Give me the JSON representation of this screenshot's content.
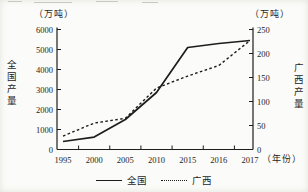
{
  "chart_data": {
    "type": "line",
    "categories": [
      "1995",
      "2000",
      "2005",
      "2010",
      "2015",
      "2016",
      "2017"
    ],
    "series": [
      {
        "name": "全国",
        "axis": "left",
        "style": "solid",
        "values": [
          400,
          620,
          1500,
          2850,
          5100,
          5300,
          5450
        ]
      },
      {
        "name": "广西",
        "axis": "right",
        "style": "dashed",
        "values": [
          28,
          55,
          65,
          128,
          153,
          175,
          227
        ]
      }
    ],
    "left_axis": {
      "unit": "（万吨）",
      "title": "全国产量",
      "min": 0,
      "max": 6000,
      "step": 1000,
      "ticks": [
        "0",
        "1000",
        "2000",
        "3000",
        "4000",
        "5000",
        "6000"
      ]
    },
    "right_axis": {
      "unit": "（万吨）",
      "title": "广西产量",
      "min": 0,
      "max": 250,
      "step": 50,
      "ticks": [
        "0",
        "50",
        "100",
        "150",
        "200",
        "250"
      ]
    },
    "x_axis": {
      "unit": "（年份）"
    },
    "legend": [
      {
        "name": "全国",
        "style": "solid"
      },
      {
        "name": "广西",
        "style": "dashed"
      }
    ],
    "colors": {
      "line": "#1d1d1d",
      "text": "#1d1d1d",
      "background": "#fbfbf9"
    },
    "layout": {
      "grid": false,
      "legend_position": "bottom-center"
    }
  }
}
